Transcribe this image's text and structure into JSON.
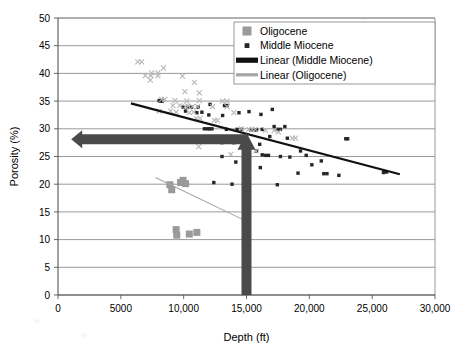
{
  "chart_data": {
    "type": "scatter",
    "title": "",
    "xlabel": "Depth (ft)",
    "ylabel": "Porosity (%)",
    "xlim": [
      0,
      30000
    ],
    "ylim": [
      0,
      50
    ],
    "xticks": [
      0,
      5000,
      10000,
      15000,
      20000,
      25000,
      30000
    ],
    "xtick_labels": [
      "0",
      "5000",
      "10,000",
      "15,000",
      "20,000",
      "25,000",
      "30,000"
    ],
    "yticks": [
      0,
      5,
      10,
      15,
      20,
      25,
      30,
      35,
      40,
      45,
      50
    ],
    "ytick_labels": [
      "0",
      "5",
      "10",
      "15",
      "20",
      "25",
      "30",
      "35",
      "40",
      "45",
      "50"
    ],
    "grid": "horizontal",
    "legend_position": "top-right",
    "series": [
      {
        "name": "Oligocene",
        "marker": "square",
        "color": "#9a9a9a",
        "marker_size": 7,
        "points": [
          [
            8900,
            19.9
          ],
          [
            9050,
            19.0
          ],
          [
            9750,
            20.3
          ],
          [
            9950,
            20.7
          ],
          [
            10150,
            20.1
          ],
          [
            9400,
            11.8
          ],
          [
            9450,
            10.8
          ],
          [
            10450,
            11.0
          ],
          [
            11050,
            11.3
          ]
        ]
      },
      {
        "name": "Middle Miocene",
        "marker": "square",
        "color": "#262626",
        "marker_size": 3.4,
        "points": [
          [
            8050,
            35.1
          ],
          [
            8150,
            35.0
          ],
          [
            8300,
            35.0
          ],
          [
            9950,
            33.9
          ],
          [
            10300,
            33.9
          ],
          [
            10600,
            33.9
          ],
          [
            11150,
            33.9
          ],
          [
            12100,
            34.4
          ],
          [
            13250,
            34.2
          ],
          [
            13450,
            34.2
          ],
          [
            10150,
            33.2
          ],
          [
            11050,
            32.9
          ],
          [
            11450,
            33.0
          ],
          [
            12000,
            32.5
          ],
          [
            13100,
            32.4
          ],
          [
            14400,
            32.9
          ],
          [
            15200,
            33.1
          ],
          [
            16150,
            32.6
          ],
          [
            17050,
            33.5
          ],
          [
            11650,
            30.0
          ],
          [
            11900,
            30.0
          ],
          [
            12050,
            30.0
          ],
          [
            12250,
            30.0
          ],
          [
            13400,
            29.9
          ],
          [
            14250,
            29.9
          ],
          [
            14600,
            29.9
          ],
          [
            15350,
            29.8
          ],
          [
            15600,
            29.8
          ],
          [
            15800,
            29.8
          ],
          [
            16250,
            29.9
          ],
          [
            17450,
            29.9
          ],
          [
            17700,
            29.9
          ],
          [
            12700,
            27.6
          ],
          [
            13050,
            27.5
          ],
          [
            14000,
            27.5
          ],
          [
            15200,
            27.0
          ],
          [
            16050,
            27.2
          ],
          [
            16850,
            28.6
          ],
          [
            18250,
            28.3
          ],
          [
            13050,
            25.0
          ],
          [
            14150,
            24.0
          ],
          [
            15100,
            26.2
          ],
          [
            15800,
            26.0
          ],
          [
            16250,
            25.3
          ],
          [
            16500,
            25.2
          ],
          [
            16750,
            25.2
          ],
          [
            17700,
            25.0
          ],
          [
            18450,
            24.9
          ],
          [
            19300,
            26.0
          ],
          [
            19750,
            25.2
          ],
          [
            20200,
            23.5
          ],
          [
            20950,
            24.2
          ],
          [
            14900,
            22.1
          ],
          [
            16100,
            23.0
          ],
          [
            19100,
            22.0
          ],
          [
            21150,
            21.9
          ],
          [
            21400,
            21.9
          ],
          [
            22350,
            21.6
          ],
          [
            25900,
            22.1
          ],
          [
            26150,
            22.2
          ],
          [
            17200,
            30.4
          ],
          [
            18050,
            30.4
          ],
          [
            22900,
            28.2
          ],
          [
            23050,
            28.2
          ],
          [
            12400,
            20.3
          ],
          [
            13850,
            20.0
          ],
          [
            17450,
            19.9
          ]
        ]
      },
      {
        "name": "Oligocene (x markers)",
        "marker": "x",
        "color": "#b5b5b5",
        "marker_size": 5,
        "points": [
          [
            6350,
            42.1
          ],
          [
            6650,
            42.1
          ],
          [
            8400,
            41.0
          ],
          [
            7450,
            40.1
          ],
          [
            7950,
            40.1
          ],
          [
            6950,
            39.6
          ],
          [
            7400,
            39.6
          ],
          [
            7950,
            39.6
          ],
          [
            7350,
            38.8
          ],
          [
            9900,
            39.5
          ],
          [
            10850,
            38.4
          ],
          [
            10100,
            36.7
          ],
          [
            11250,
            36.5
          ],
          [
            8250,
            35.3
          ],
          [
            8500,
            35.3
          ],
          [
            9300,
            35.1
          ],
          [
            10250,
            35.0
          ],
          [
            11250,
            35.1
          ],
          [
            13100,
            35.0
          ],
          [
            13450,
            35.0
          ],
          [
            9150,
            34.2
          ],
          [
            9700,
            34.2
          ],
          [
            10150,
            34.0
          ],
          [
            10350,
            34.1
          ],
          [
            10700,
            34.0
          ],
          [
            11100,
            34.0
          ],
          [
            12300,
            34.0
          ],
          [
            13450,
            34.0
          ],
          [
            8050,
            33.2
          ],
          [
            8950,
            33.2
          ],
          [
            9400,
            33.0
          ],
          [
            10450,
            32.9
          ],
          [
            10800,
            33.0
          ],
          [
            14000,
            32.9
          ],
          [
            11000,
            31.9
          ],
          [
            11300,
            31.9
          ],
          [
            12450,
            31.5
          ],
          [
            12700,
            31.5
          ],
          [
            14600,
            30.0
          ],
          [
            15200,
            29.9
          ],
          [
            15450,
            29.9
          ],
          [
            15700,
            29.9
          ],
          [
            16500,
            29.7
          ],
          [
            17200,
            29.7
          ],
          [
            17550,
            29.4
          ],
          [
            18650,
            28.3
          ],
          [
            18900,
            28.3
          ],
          [
            11200,
            26.8
          ],
          [
            15750,
            26.0
          ],
          [
            13750,
            25.4
          ]
        ]
      }
    ],
    "trendlines": [
      {
        "name": "Linear (Middle Miocene)",
        "color": "#111111",
        "width": 2.2,
        "x0": 5800,
        "y0": 34.6,
        "x1": 27200,
        "y1": 21.8
      },
      {
        "name": "Linear (Oligocene)",
        "color": "#a5a5a5",
        "width": 1.1,
        "x0": 7750,
        "y0": 21.2,
        "x1": 15100,
        "y1": 13.2
      }
    ],
    "annotations": [
      {
        "name": "horizontal-arrow",
        "type": "arrow",
        "direction": "left",
        "color": "#4a4a4a",
        "y": 28.1,
        "x_tail": 15000,
        "x_head": 1050,
        "thickness": 10
      },
      {
        "name": "vertical-arrow",
        "type": "arrow",
        "direction": "up",
        "color": "#4a4a4a",
        "x": 15000,
        "y_tail": 0,
        "y_head": 29.3,
        "thickness": 10
      }
    ],
    "legend": [
      {
        "label": "Oligocene",
        "marker": "square",
        "color": "#9a9a9a"
      },
      {
        "label": "Middle Miocene",
        "marker": "small-square",
        "color": "#262626"
      },
      {
        "label": "Linear (Middle Miocene)",
        "marker": "thick-line",
        "color": "#111111"
      },
      {
        "label": "Linear (Oligocene)",
        "marker": "line",
        "color": "#a5a5a5"
      }
    ]
  },
  "axes": {
    "ylabel": "Porosity (%)",
    "xlabel": "Depth (ft)"
  }
}
